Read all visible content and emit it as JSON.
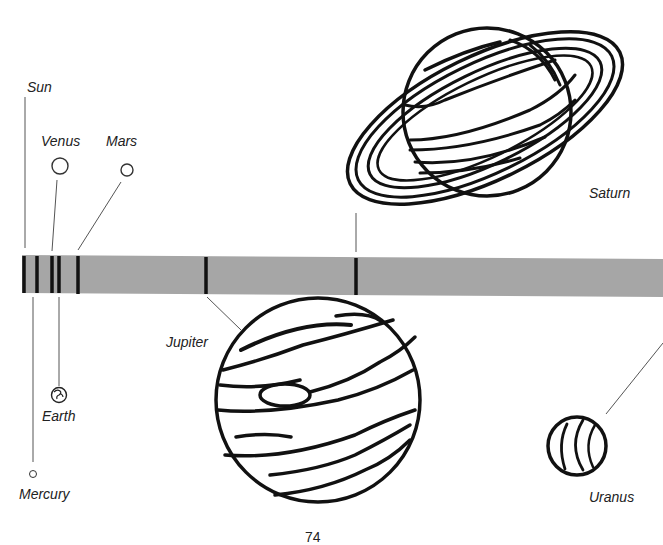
{
  "diagram": {
    "type": "solar-system-distance-scale",
    "bar_color": "#a6a6a6",
    "tick_color": "#111111",
    "planets": [
      {
        "name": "Sun",
        "label": "Sun"
      },
      {
        "name": "Mercury",
        "label": "Mercury"
      },
      {
        "name": "Venus",
        "label": "Venus"
      },
      {
        "name": "Earth",
        "label": "Earth"
      },
      {
        "name": "Mars",
        "label": "Mars"
      },
      {
        "name": "Jupiter",
        "label": "Jupiter"
      },
      {
        "name": "Saturn",
        "label": "Saturn"
      },
      {
        "name": "Uranus",
        "label": "Uranus"
      }
    ],
    "page_number": "74"
  }
}
